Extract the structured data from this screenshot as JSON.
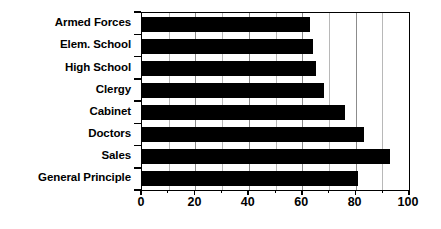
{
  "chart_data": {
    "type": "bar",
    "orientation": "horizontal",
    "title": "",
    "subtitle": "",
    "xlabel": "",
    "ylabel": "",
    "categories": [
      "Armed Forces",
      "Elem. School",
      "High School",
      "Clergy",
      "Cabinet",
      "Doctors",
      "Sales",
      "General Principle"
    ],
    "values": [
      63,
      64,
      65,
      68,
      76,
      83,
      93,
      81
    ],
    "series": [
      {
        "name": "",
        "values": [
          63,
          64,
          65,
          68,
          76,
          83,
          93,
          81
        ]
      }
    ],
    "xlim": [
      0,
      100
    ],
    "x_ticks": [
      0,
      20,
      40,
      60,
      80,
      100
    ],
    "x_tick_labels": [
      "0",
      "20",
      "40",
      "60",
      "80",
      "100"
    ],
    "x_minor_ticks": [
      10,
      30,
      50,
      70,
      90
    ],
    "grid": true,
    "grid_axis": "x",
    "legend": false,
    "legend_position": "none",
    "bar_color": "#000000",
    "grid_color": "#8c8c8c",
    "axis_color": "#000000",
    "background_color": "#ffffff"
  }
}
